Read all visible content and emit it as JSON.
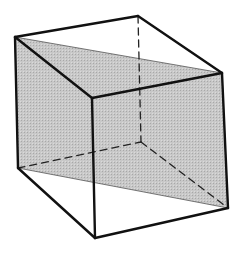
{
  "diagram": {
    "colors": {
      "background": "#ffffff",
      "edge": "#111111",
      "plane_fill": "#c4c4c4",
      "plane_outline": "#555555"
    },
    "vertices": {
      "A_top_back_left": [
        15,
        37
      ],
      "B_top_back_right": [
        138,
        16
      ],
      "C_top_right": [
        222,
        73
      ],
      "D_top_front": [
        92,
        98
      ],
      "E_bottom_left": [
        18,
        168
      ],
      "F_bottom_back": [
        141,
        142
      ],
      "G_bottom_right": [
        228,
        208
      ],
      "H_bottom_front": [
        95,
        238
      ]
    },
    "shaded_plane": [
      "A_top_back_left",
      "C_top_right",
      "G_bottom_right",
      "E_bottom_left"
    ],
    "visible_edges": [
      [
        "A_top_back_left",
        "B_top_back_right"
      ],
      [
        "B_top_back_right",
        "C_top_right"
      ],
      [
        "A_top_back_left",
        "D_top_front"
      ],
      [
        "D_top_front",
        "C_top_right"
      ],
      [
        "A_top_back_left",
        "E_bottom_left"
      ],
      [
        "D_top_front",
        "H_bottom_front"
      ],
      [
        "C_top_right",
        "G_bottom_right"
      ],
      [
        "E_bottom_left",
        "H_bottom_front"
      ],
      [
        "H_bottom_front",
        "G_bottom_right"
      ]
    ],
    "hidden_edges": [
      [
        "B_top_back_right",
        "F_bottom_back"
      ],
      [
        "E_bottom_left",
        "F_bottom_back"
      ],
      [
        "F_bottom_back",
        "G_bottom_right"
      ]
    ]
  }
}
